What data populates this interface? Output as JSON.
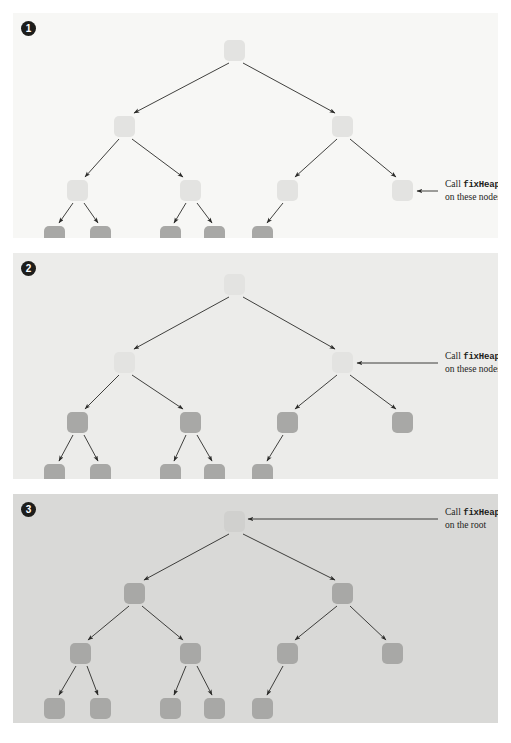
{
  "figure": {
    "type": "diagram",
    "background": "#ffffff",
    "width": 511,
    "height": 743
  },
  "colors": {
    "panel1_bg": "#f7f7f5",
    "panel2_bg": "#ececea",
    "panel3_bg": "#d9d9d7",
    "node_light": "#e3e3e1",
    "node_light_p3": "#d0d0ce",
    "node_dark": "#a8a8a6",
    "badge_bg": "#1d1d1b",
    "badge_fg": "#ffffff",
    "arrow": "#2b2b29",
    "text": "#1d1d1b"
  },
  "panels": [
    {
      "id": "panel-1",
      "badge": "1",
      "callout": {
        "line1_prefix": "Call ",
        "line1_code": "fixHeap",
        "line2": "on these nodes",
        "arrow_direction": "left",
        "points_at": "level-2 nodes"
      },
      "tree": {
        "levels": 4,
        "node_states": {
          "root": "light",
          "level1": "light",
          "level2": "light",
          "level3": "dark"
        },
        "nodes": [
          {
            "id": "r",
            "level": 0,
            "cx": 222,
            "cy": 38,
            "state": "light"
          },
          {
            "id": "l1-0",
            "level": 1,
            "cx": 112,
            "cy": 114,
            "state": "light"
          },
          {
            "id": "l1-1",
            "level": 1,
            "cx": 330,
            "cy": 114,
            "state": "light"
          },
          {
            "id": "l2-0",
            "level": 2,
            "cx": 65,
            "cy": 178,
            "state": "light"
          },
          {
            "id": "l2-1",
            "level": 2,
            "cx": 178,
            "cy": 178,
            "state": "light"
          },
          {
            "id": "l2-2",
            "level": 2,
            "cx": 275,
            "cy": 178,
            "state": "light"
          },
          {
            "id": "l2-3",
            "level": 2,
            "cx": 390,
            "cy": 178,
            "state": "light"
          },
          {
            "id": "l3-0",
            "level": 3,
            "cx": 42,
            "cy": 224,
            "state": "dark"
          },
          {
            "id": "l3-1",
            "level": 3,
            "cx": 88,
            "cy": 224,
            "state": "dark"
          },
          {
            "id": "l3-2",
            "level": 3,
            "cx": 158,
            "cy": 224,
            "state": "dark"
          },
          {
            "id": "l3-3",
            "level": 3,
            "cx": 202,
            "cy": 224,
            "state": "dark"
          },
          {
            "id": "l3-4",
            "level": 3,
            "cx": 250,
            "cy": 224,
            "state": "dark"
          }
        ],
        "edges": [
          [
            "r",
            "l1-0"
          ],
          [
            "r",
            "l1-1"
          ],
          [
            "l1-0",
            "l2-0"
          ],
          [
            "l1-0",
            "l2-1"
          ],
          [
            "l1-1",
            "l2-2"
          ],
          [
            "l1-1",
            "l2-3"
          ],
          [
            "l2-0",
            "l3-0"
          ],
          [
            "l2-0",
            "l3-1"
          ],
          [
            "l2-1",
            "l3-2"
          ],
          [
            "l2-1",
            "l3-3"
          ],
          [
            "l2-2",
            "l3-4"
          ]
        ]
      }
    },
    {
      "id": "panel-2",
      "badge": "2",
      "callout": {
        "line1_prefix": "Call ",
        "line1_code": "fixHeap",
        "line2": "on these nodes",
        "arrow_direction": "left",
        "points_at": "level-1 nodes"
      },
      "tree": {
        "levels": 4,
        "node_states": {
          "root": "light",
          "level1": "light",
          "level2": "dark",
          "level3": "dark"
        },
        "nodes": [
          {
            "id": "r",
            "level": 0,
            "cx": 222,
            "cy": 32,
            "state": "light"
          },
          {
            "id": "l1-0",
            "level": 1,
            "cx": 112,
            "cy": 110,
            "state": "light"
          },
          {
            "id": "l1-1",
            "level": 1,
            "cx": 330,
            "cy": 110,
            "state": "light"
          },
          {
            "id": "l2-0",
            "level": 2,
            "cx": 65,
            "cy": 170,
            "state": "dark"
          },
          {
            "id": "l2-1",
            "level": 2,
            "cx": 178,
            "cy": 170,
            "state": "dark"
          },
          {
            "id": "l2-2",
            "level": 2,
            "cx": 275,
            "cy": 170,
            "state": "dark"
          },
          {
            "id": "l2-3",
            "level": 2,
            "cx": 390,
            "cy": 170,
            "state": "dark"
          },
          {
            "id": "l3-0",
            "level": 3,
            "cx": 42,
            "cy": 222,
            "state": "dark"
          },
          {
            "id": "l3-1",
            "level": 3,
            "cx": 88,
            "cy": 222,
            "state": "dark"
          },
          {
            "id": "l3-2",
            "level": 3,
            "cx": 158,
            "cy": 222,
            "state": "dark"
          },
          {
            "id": "l3-3",
            "level": 3,
            "cx": 202,
            "cy": 222,
            "state": "dark"
          },
          {
            "id": "l3-4",
            "level": 3,
            "cx": 250,
            "cy": 222,
            "state": "dark"
          }
        ],
        "edges": [
          [
            "r",
            "l1-0"
          ],
          [
            "r",
            "l1-1"
          ],
          [
            "l1-0",
            "l2-0"
          ],
          [
            "l1-0",
            "l2-1"
          ],
          [
            "l1-1",
            "l2-2"
          ],
          [
            "l1-1",
            "l2-3"
          ],
          [
            "l2-0",
            "l3-0"
          ],
          [
            "l2-0",
            "l3-1"
          ],
          [
            "l2-1",
            "l3-2"
          ],
          [
            "l2-1",
            "l3-3"
          ],
          [
            "l2-2",
            "l3-4"
          ]
        ]
      }
    },
    {
      "id": "panel-3",
      "badge": "3",
      "callout": {
        "line1_prefix": "Call ",
        "line1_code": "fixHeap",
        "line2": "on the root",
        "arrow_direction": "left",
        "points_at": "root node"
      },
      "tree": {
        "levels": 4,
        "node_states": {
          "root": "light",
          "level1": "dark",
          "level2": "dark",
          "level3": "dark"
        },
        "nodes": [
          {
            "id": "r",
            "level": 0,
            "cx": 222,
            "cy": 28,
            "state": "light"
          },
          {
            "id": "l1-0",
            "level": 1,
            "cx": 122,
            "cy": 100,
            "state": "dark"
          },
          {
            "id": "l1-1",
            "level": 1,
            "cx": 330,
            "cy": 100,
            "state": "dark"
          },
          {
            "id": "l2-0",
            "level": 2,
            "cx": 68,
            "cy": 160,
            "state": "dark"
          },
          {
            "id": "l2-1",
            "level": 2,
            "cx": 178,
            "cy": 160,
            "state": "dark"
          },
          {
            "id": "l2-2",
            "level": 2,
            "cx": 275,
            "cy": 160,
            "state": "dark"
          },
          {
            "id": "l2-3",
            "level": 2,
            "cx": 380,
            "cy": 160,
            "state": "dark"
          },
          {
            "id": "l3-0",
            "level": 3,
            "cx": 42,
            "cy": 215,
            "state": "dark"
          },
          {
            "id": "l3-1",
            "level": 3,
            "cx": 88,
            "cy": 215,
            "state": "dark"
          },
          {
            "id": "l3-2",
            "level": 3,
            "cx": 158,
            "cy": 215,
            "state": "dark"
          },
          {
            "id": "l3-3",
            "level": 3,
            "cx": 202,
            "cy": 215,
            "state": "dark"
          },
          {
            "id": "l3-4",
            "level": 3,
            "cx": 250,
            "cy": 215,
            "state": "dark"
          }
        ],
        "edges": [
          [
            "r",
            "l1-0"
          ],
          [
            "r",
            "l1-1"
          ],
          [
            "l1-0",
            "l2-0"
          ],
          [
            "l1-0",
            "l2-1"
          ],
          [
            "l1-1",
            "l2-2"
          ],
          [
            "l1-1",
            "l2-3"
          ],
          [
            "l2-0",
            "l3-0"
          ],
          [
            "l2-0",
            "l3-1"
          ],
          [
            "l2-1",
            "l3-2"
          ],
          [
            "l2-1",
            "l3-3"
          ],
          [
            "l2-2",
            "l3-4"
          ]
        ]
      }
    }
  ]
}
